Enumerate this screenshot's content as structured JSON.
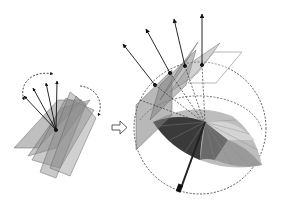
{
  "diagram": {
    "left_group": {
      "label": "rotating-planes",
      "plane_count": 5,
      "arrow_count": 4,
      "plane_color": "#7a7a7a",
      "arrow_color": "#111111"
    },
    "transition_arrow": "⇨",
    "right_group": {
      "label": "planes-on-sphere",
      "plane_count": 5,
      "arrow_count": 5,
      "sphere_style": "dashed",
      "umbrella_colors": [
        "#2a2a2a",
        "#4a4a4a",
        "#6b6b6b",
        "#8d8d8d",
        "#b0b0b0",
        "#d0d0d0"
      ]
    }
  }
}
